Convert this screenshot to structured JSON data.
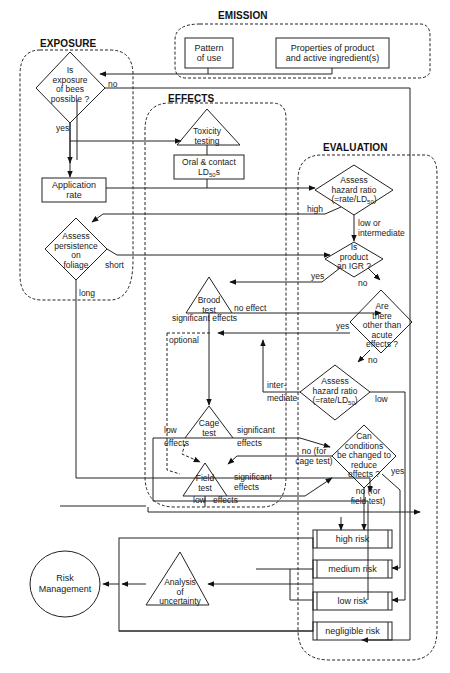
{
  "sections": {
    "emission": "EMISSION",
    "exposure": "EXPOSURE",
    "effects": "EFFECTS",
    "evaluation": "EVALUATION"
  },
  "emission": {
    "pattern_of_use": [
      "Pattern",
      "of use"
    ],
    "properties": [
      "Properties of product",
      "and active ingredient(s)"
    ]
  },
  "exposure": {
    "question": [
      "Is",
      "exposure",
      "of bees",
      "possible ?"
    ],
    "no_label": "no",
    "yes_label": "yes",
    "application_rate": [
      "Application",
      "rate"
    ],
    "persistence": [
      "Assess",
      "persistence",
      "on",
      "foliage"
    ],
    "short_label": "short",
    "long_label": "long"
  },
  "effects": {
    "toxicity_testing": [
      "Toxicity",
      "testing"
    ],
    "oral_contact": [
      "Oral & contact",
      "LD",
      "50",
      "s"
    ],
    "brood_test": [
      "Brood",
      "test"
    ],
    "brood_no_effect": "no effect",
    "brood_significant": "significant effects",
    "optional": "optional",
    "cage_test": [
      "Cage",
      "test"
    ],
    "cage_low_effects": [
      "low",
      "effects"
    ],
    "cage_significant": [
      "significant",
      "effects"
    ],
    "field_test": [
      "Field",
      "test"
    ],
    "field_significant": [
      "significant",
      "effects"
    ],
    "field_low": "low",
    "field_effects": "effects"
  },
  "evaluation": {
    "hazard_ratio_1": [
      "Assess",
      "hazard ratio",
      "(=rate/LD",
      "50",
      ")"
    ],
    "high_label": "high",
    "low_or_intermediate": [
      "low or",
      "intermediate"
    ],
    "is_igr": [
      "Is",
      "product",
      "an IGR ?"
    ],
    "igr_yes": "yes",
    "igr_no": "no",
    "other_effects": [
      "Are",
      "there",
      "other than",
      "acute",
      "effects ?"
    ],
    "other_yes": "yes",
    "other_no": "no",
    "hazard_ratio_2": [
      "Assess",
      "hazard ratio",
      "(=rate/LD",
      "50",
      ")"
    ],
    "intermediate_label": [
      "inter-",
      "mediate"
    ],
    "low_label": "low",
    "can_conditions": [
      "Can",
      "conditions",
      "be changed to",
      "reduce",
      "effects ?"
    ],
    "no_for_cage": [
      "no (for",
      "cage test)"
    ],
    "yes_label": "yes",
    "no_for_field": [
      "no (for",
      "field test)"
    ]
  },
  "risk_levels": [
    "high risk",
    "medium risk",
    "low risk",
    "negligible risk"
  ],
  "uncertainty": [
    "Analysis",
    "of",
    "uncertainty"
  ],
  "risk_management": [
    "Risk",
    "Management"
  ]
}
